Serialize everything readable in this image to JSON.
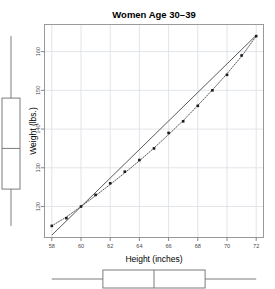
{
  "chart_data": {
    "type": "scatter",
    "title": "Women Age 30–39",
    "xlabel": "Height (inches)",
    "ylabel": "Weight (lbs.)",
    "x": [
      58,
      59,
      60,
      61,
      62,
      63,
      64,
      65,
      66,
      67,
      68,
      69,
      70,
      71,
      72
    ],
    "y": [
      115,
      117,
      120,
      123,
      126,
      129,
      132,
      135,
      139,
      142,
      146,
      150,
      154,
      159,
      164
    ],
    "series": [
      {
        "name": "observations",
        "marker": "filled-square",
        "values": [
          115,
          117,
          120,
          123,
          126,
          129,
          132,
          135,
          139,
          142,
          146,
          150,
          154,
          159,
          164
        ]
      },
      {
        "name": "linear-fit",
        "style": "solid",
        "endpoints": [
          [
            58,
            112.6
          ],
          [
            72,
            164.2
          ]
        ]
      },
      {
        "name": "lowess-smooth",
        "style": "dotted",
        "values": [
          115,
          117.3,
          120,
          122.8,
          125.7,
          128.7,
          131.8,
          135.1,
          138.6,
          142.2,
          146.1,
          150.1,
          154.3,
          158.8,
          164
        ]
      }
    ],
    "xlim": [
      57.5,
      72.5
    ],
    "ylim": [
      112,
      167
    ],
    "xticks": [
      58,
      60,
      62,
      64,
      66,
      68,
      70,
      72
    ],
    "yticks": [
      120,
      130,
      140,
      150,
      160
    ],
    "grid": true,
    "grid_color": "#d9dde3",
    "legend": "none",
    "point_color": "#1a1a1a",
    "line_color": "#5a5a5a",
    "frame_color": "#999999"
  },
  "marginal_boxplots": {
    "y_boxplot": {
      "name": "weight-boxplot",
      "orientation": "vertical",
      "whisker_low": 115,
      "q1": 124.5,
      "median": 135,
      "q3": 148,
      "whisker_high": 164
    },
    "x_boxplot": {
      "name": "height-boxplot",
      "orientation": "horizontal",
      "whisker_low": 58,
      "q1": 61.5,
      "median": 65,
      "q3": 68.5,
      "whisker_high": 72
    }
  }
}
